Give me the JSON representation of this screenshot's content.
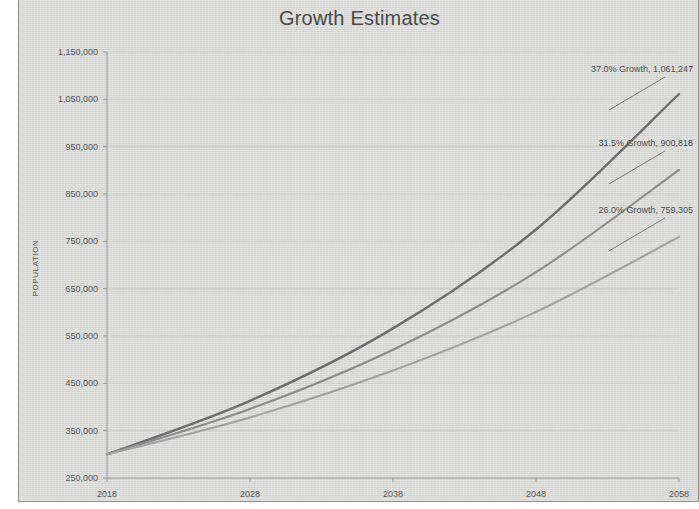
{
  "page": {
    "background_color": "#ffffff",
    "card_background_color": "#d9d9d6",
    "border_color": "#8f8f8c"
  },
  "chart_data": {
    "type": "line",
    "title": "Growth Estimates",
    "xlabel": "",
    "ylabel": "POPULATION",
    "x": [
      2018,
      2028,
      2038,
      2048,
      2058
    ],
    "xtick_labels": [
      "2018",
      "2028",
      "2038",
      "2048",
      "2058"
    ],
    "xlim": [
      2018,
      2058
    ],
    "ylim": [
      250000,
      1150000
    ],
    "ytick_values": [
      250000,
      350000,
      450000,
      550000,
      650000,
      750000,
      850000,
      950000,
      1050000,
      1150000
    ],
    "ytick_labels": [
      "250,000",
      "350,000",
      "450,000",
      "550,000",
      "650,000",
      "750,000",
      "850,000",
      "950,000",
      "1,050,000",
      "1,150,000"
    ],
    "grid": true,
    "legend": "none",
    "series": [
      {
        "name": "37.0% Growth",
        "color": "#6e6e70",
        "annotation": "37.0% Growth, 1,061,247",
        "end_value": 1061247,
        "values": [
          300000,
          413000,
          566000,
          775000,
          1061247
        ]
      },
      {
        "name": "31.5% Growth",
        "color": "#8c8c8e",
        "annotation": "31.5% Growth, 900,818",
        "end_value": 900818,
        "values": [
          300000,
          396000,
          521000,
          685000,
          900818
        ]
      },
      {
        "name": "26.0% Growth",
        "color": "#a2a2a3",
        "annotation": "26.0% Growth, 759,305",
        "end_value": 759305,
        "values": [
          300000,
          378000,
          477000,
          601000,
          759305
        ]
      }
    ],
    "annotations": [
      {
        "text": "37.0% Growth, 1,061,247",
        "series": "37.0% Growth"
      },
      {
        "text": "31.5% Growth, 900,818",
        "series": "31.5% Growth"
      },
      {
        "text": "26.0% Growth, 759,305",
        "series": "26.0% Growth"
      }
    ]
  }
}
